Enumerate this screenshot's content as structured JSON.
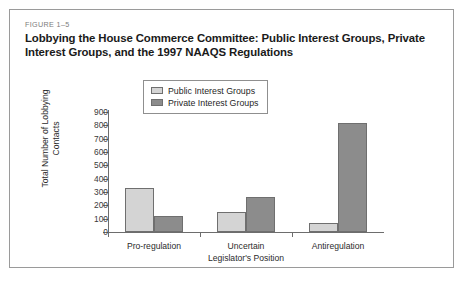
{
  "figure": {
    "number": "FIGURE 1–5",
    "title": "Lobbying the House Commerce Committee: Public Interest Groups, Private Interest Groups, and the 1997 NAAQS Regulations"
  },
  "legend": {
    "entries": [
      {
        "label": "Public Interest Groups",
        "color": "#d4d4d4",
        "icon": "legend-swatch-icon"
      },
      {
        "label": "Private Interest Groups",
        "color": "#8c8c8c",
        "icon": "legend-swatch-icon"
      }
    ]
  },
  "axes": {
    "y_title": "Total Number of Lobbying Contacts",
    "y_ticks": [
      "900",
      "800",
      "700",
      "600",
      "500",
      "400",
      "300",
      "200",
      "100",
      "0"
    ],
    "x_title": "Legislator's Position",
    "x_categories": [
      "Pro-regulation",
      "Uncertain",
      "Antiregulation"
    ]
  },
  "chart_data": {
    "type": "bar",
    "title": "Lobbying the House Commerce Committee: Public Interest Groups, Private Interest Groups, and the 1997 NAAQS Regulations",
    "xlabel": "Legislator's Position",
    "ylabel": "Total Number of Lobbying Contacts",
    "categories": [
      "Pro-regulation",
      "Uncertain",
      "Antiregulation"
    ],
    "series": [
      {
        "name": "Public Interest Groups",
        "color": "#d4d4d4",
        "values": [
          330,
          150,
          70
        ]
      },
      {
        "name": "Private Interest Groups",
        "color": "#8c8c8c",
        "values": [
          120,
          260,
          820
        ]
      }
    ],
    "ylim": [
      0,
      900
    ],
    "ytick_step": 100,
    "grid": false,
    "legend_position": "top-center"
  }
}
